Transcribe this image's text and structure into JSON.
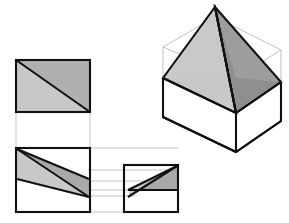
{
  "figure": {
    "background_color": "#ffffff",
    "line_color": "#111111",
    "construction_line_color": "#b4b4b4",
    "wireframe_line_color": "#b9b9b9",
    "fill_light": "#c8c8c8",
    "fill_mid": "#b0b0b0",
    "fill_dark": "#8f8f8f",
    "fill_white": "#ffffff"
  },
  "views": {
    "top_view": {
      "name": "Top view",
      "label": "",
      "box": {
        "x": 16,
        "y": 60,
        "w": 74,
        "h": 52
      },
      "diagonal": {
        "from": [
          16,
          60
        ],
        "to": [
          90,
          112
        ]
      },
      "faces": [
        {
          "name": "upper-right-triangle",
          "fill": "#b0b0b0",
          "points": "16,60 90,60 90,112"
        },
        {
          "name": "lower-left-triangle",
          "fill": "#c8c8c8",
          "points": "16,60 90,112 16,112"
        }
      ]
    },
    "front_view": {
      "name": "Front view",
      "label": "",
      "box": {
        "x": 16,
        "y": 148,
        "w": 74,
        "h": 64
      },
      "faces": [
        {
          "name": "front-upper-dark-wedge",
          "fill": "#aaaaaa",
          "points": "18,150 88,180 88,196 18,150"
        },
        {
          "name": "front-lower-light-wedge",
          "fill": "#c8c8c8",
          "points": "18,150 88,196 18,178"
        }
      ],
      "edges": [
        {
          "name": "ridge-line",
          "from": [
            18,
            150
          ],
          "to": [
            88,
            196
          ]
        },
        {
          "name": "slope-line-upper",
          "from": [
            18,
            150
          ],
          "to": [
            88,
            180
          ]
        },
        {
          "name": "eave-line",
          "from": [
            18,
            178
          ],
          "to": [
            88,
            196
          ]
        }
      ]
    },
    "side_view": {
      "name": "Right side view",
      "label": "",
      "box": {
        "x": 124,
        "y": 165,
        "w": 54,
        "h": 47
      },
      "faces": [
        {
          "name": "side-upper-dark-wedge",
          "fill": "#aaaaaa",
          "points": "176,167 176,190 128,190 176,167"
        },
        {
          "name": "side-lower-light-wedge",
          "fill": "#c8c8c8",
          "points": "176,167 128,190 128,196 176,190"
        }
      ],
      "edges": [
        {
          "name": "ridge-line",
          "from": [
            176,
            167
          ],
          "to": [
            128,
            196
          ]
        },
        {
          "name": "slope-line-upper",
          "from": [
            176,
            167
          ],
          "to": [
            128,
            190
          ]
        },
        {
          "name": "eave-line",
          "from": [
            128,
            190
          ],
          "to": [
            176,
            190
          ]
        }
      ]
    },
    "isometric_view": {
      "name": "Isometric pictorial view",
      "label": "",
      "apex": [
        215,
        7
      ],
      "left_corner": [
        163,
        78
      ],
      "right_corner": [
        281,
        82
      ],
      "front_corner": [
        236,
        113
      ],
      "bottom_front": [
        236,
        152
      ],
      "faces": [
        {
          "name": "roof-left-face",
          "fill": "#c8c8c8"
        },
        {
          "name": "roof-right-face",
          "fill": "#8f8f8f"
        },
        {
          "name": "roof-front-left-hip",
          "fill": "#bdbdbd"
        },
        {
          "name": "roof-front-right-hip",
          "fill": "#9a9a9a"
        },
        {
          "name": "base-left-wall",
          "fill": "#ffffff"
        },
        {
          "name": "base-right-wall",
          "fill": "#ffffff"
        }
      ]
    }
  },
  "construction_lines": {
    "name": "Projection and construction lines",
    "vertical": [
      {
        "x": 16,
        "y1": 112,
        "y2": 212
      },
      {
        "x": 90,
        "y1": 112,
        "y2": 212
      }
    ],
    "horizontal": [
      {
        "y": 148,
        "x1": 16,
        "x2": 178
      },
      {
        "y": 170,
        "x1": 88,
        "x2": 178
      },
      {
        "y": 181,
        "x1": 16,
        "x2": 178
      },
      {
        "y": 190,
        "x1": 88,
        "x2": 178
      },
      {
        "y": 196,
        "x1": 16,
        "x2": 178
      },
      {
        "y": 212,
        "x1": 88,
        "x2": 124
      }
    ]
  },
  "wireframe_box": {
    "name": "Isometric bounding box wireframe",
    "top_back": [
      215,
      37
    ],
    "left_top": [
      163,
      47
    ],
    "right_top": [
      281,
      50
    ],
    "center_top": [
      236,
      78
    ]
  }
}
